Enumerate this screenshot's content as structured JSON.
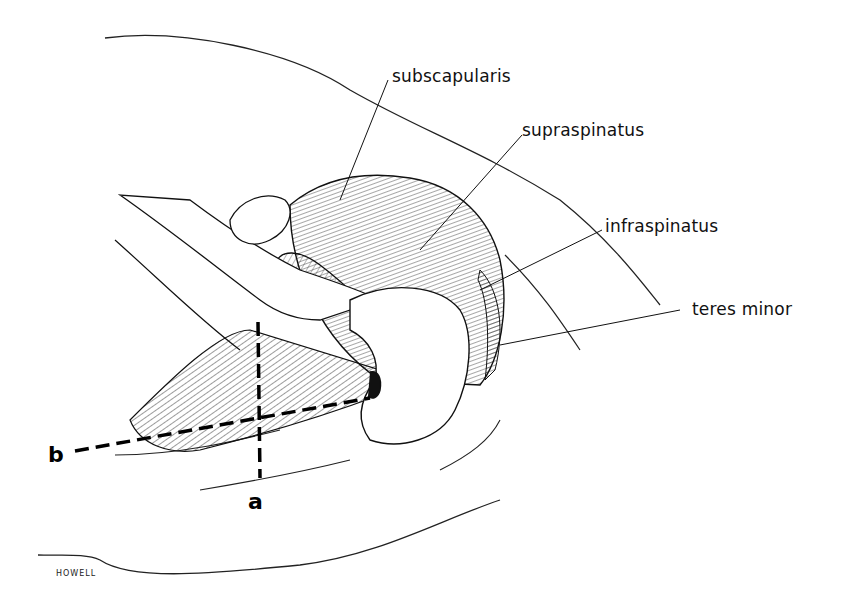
{
  "figure": {
    "labels": [
      {
        "id": "subscapularis",
        "text": "subscapularis"
      },
      {
        "id": "supraspinatus",
        "text": "supraspinatus"
      },
      {
        "id": "infraspinatus",
        "text": "infraspinatus"
      },
      {
        "id": "teres_minor",
        "text": "teres minor"
      }
    ],
    "axes": [
      {
        "id": "a",
        "text": "a"
      },
      {
        "id": "b",
        "text": "b"
      }
    ],
    "signature": "HOWELL",
    "colors": {
      "ink": "#111111",
      "background": "#ffffff"
    }
  }
}
